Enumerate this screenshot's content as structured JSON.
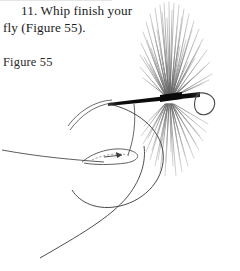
{
  "page": {
    "background_color": "#ffffff",
    "width": 240,
    "height": 271
  },
  "instruction": {
    "step_number": "11.",
    "line_1": "11. Whip finish your",
    "line_2": "fly (Figure 55).",
    "full_text": "11. Whip finish your fly (Figure 55)."
  },
  "figure": {
    "caption": "Figure 55",
    "ink_color": "#3a3a3a",
    "shank_color": "#111111",
    "hackle_color": "#8d8d8d",
    "thread_color": "#4a4a4a",
    "parts": [
      {
        "name": "hook-shank",
        "label": "hook shank"
      },
      {
        "name": "hook-eye",
        "label": "hook eye"
      },
      {
        "name": "hook-bend",
        "label": "hook bend"
      },
      {
        "name": "hackle-fibers",
        "label": "hackle fibers"
      },
      {
        "name": "thread-head",
        "label": "thread head"
      },
      {
        "name": "whip-finish-loop",
        "label": "whip finish loop"
      },
      {
        "name": "tying-thread",
        "label": "tying thread"
      },
      {
        "name": "direction-arrow",
        "label": "direction arrow"
      }
    ]
  }
}
